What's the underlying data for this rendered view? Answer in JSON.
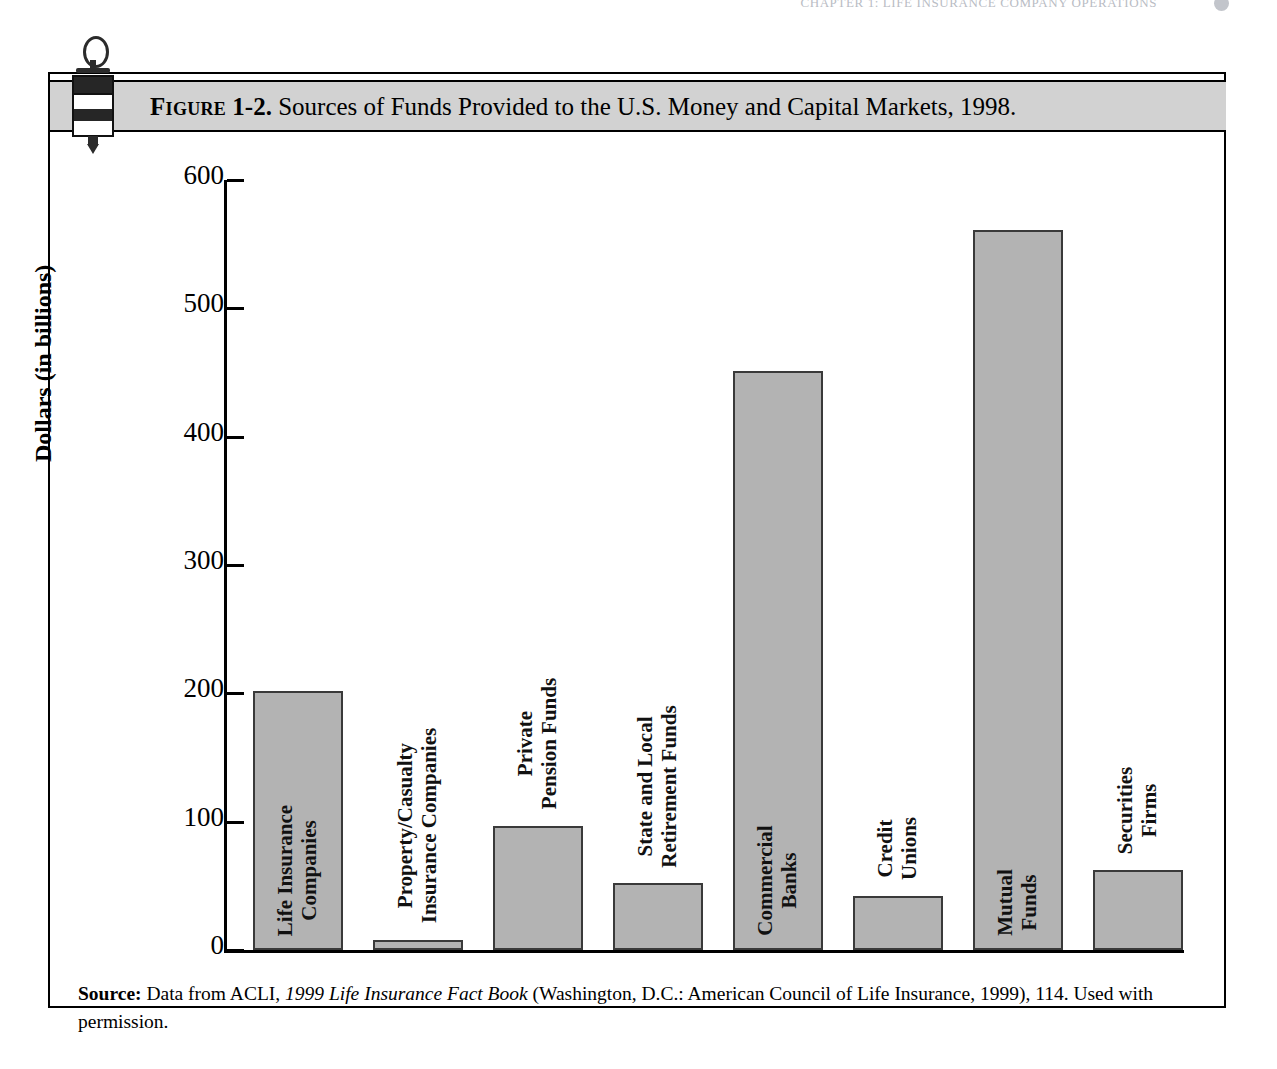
{
  "running_head": {
    "text": "CHAPTER 1: LIFE INSURANCE COMPANY OPERATIONS",
    "page_number": ""
  },
  "figure": {
    "label_word": "Figure",
    "number": "1-2.",
    "caption": "Sources of Funds Provided to the U.S. Money and Capital Markets, 1998.",
    "ornament_icon": "stamp-seal-icon",
    "band_color": "#d2d2d2",
    "bar_fill_color": "#b3b3b3",
    "bar_stroke_color": "#3a3a3a"
  },
  "source_note": {
    "label": "Source:",
    "text_before_italic": " Data from ACLI, ",
    "italic_title": "1999 Life Insurance Fact Book",
    "text_after_italic": " (Washington, D.C.: American Council of Life Insurance, 1999), 114. Used with permission."
  },
  "chart_data": {
    "type": "bar",
    "title": "Sources of Funds Provided to the U.S. Money and Capital Markets, 1998.",
    "xlabel": "",
    "ylabel": "Dollars (in billions)",
    "ylim": [
      0,
      600
    ],
    "yticks": [
      0,
      100,
      200,
      300,
      400,
      500,
      600
    ],
    "ytick_labels": [
      "0",
      "100",
      "200",
      "300",
      "400",
      "500",
      "600"
    ],
    "grid": false,
    "legend": false,
    "categories": [
      "Life Insurance\nCompanies",
      "Property/Casualty\nInsurance Companies",
      "Private\nPension Funds",
      "State and Local\nRetirement Funds",
      "Commercial\nBanks",
      "Credit\nUnions",
      "Mutual\nFunds",
      "Securities\nFirms"
    ],
    "values": [
      202,
      8,
      97,
      52,
      451,
      42,
      561,
      62
    ],
    "bars": [
      {
        "label_line1": "Life Insurance",
        "label_line2": "Companies",
        "value": 202
      },
      {
        "label_line1": "Property/Casualty",
        "label_line2": "Insurance Companies",
        "value": 8
      },
      {
        "label_line1": "Private",
        "label_line2": "Pension Funds",
        "value": 97
      },
      {
        "label_line1": "State and Local",
        "label_line2": "Retirement Funds",
        "value": 52
      },
      {
        "label_line1": "Commercial",
        "label_line2": "Banks",
        "value": 451
      },
      {
        "label_line1": "Credit",
        "label_line2": "Unions",
        "value": 42
      },
      {
        "label_line1": "Mutual",
        "label_line2": "Funds",
        "value": 561
      },
      {
        "label_line1": "Securities",
        "label_line2": "Firms",
        "value": 62
      }
    ]
  }
}
